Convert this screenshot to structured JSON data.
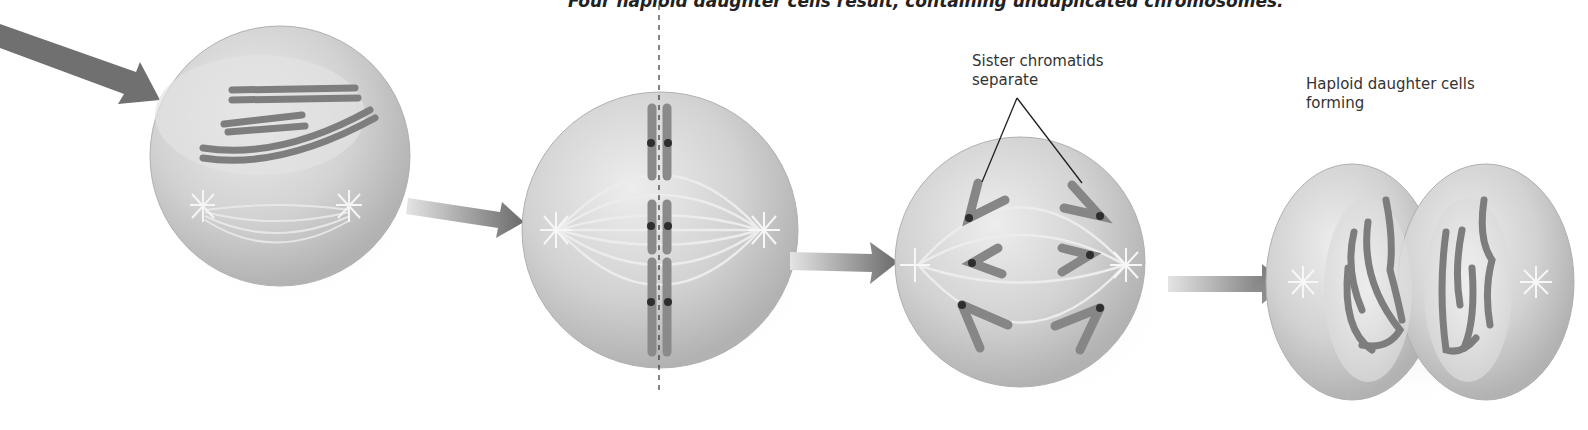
{
  "caption": "Four haploid daughter cells result, containing unduplicated chromosomes.",
  "labels": {
    "sister_chromatids_line1": "Sister chromatids",
    "sister_chromatids_line2": "separate",
    "haploid_line1": "Haploid daughter cells",
    "haploid_line2": "forming"
  },
  "stages": [
    {
      "name": "prophase-ii"
    },
    {
      "name": "metaphase-ii"
    },
    {
      "name": "anaphase-ii"
    },
    {
      "name": "telophase-ii-cytokinesis"
    }
  ],
  "colors": {
    "cell_fill": "#cfcfcf",
    "cell_edge": "#a8a8a8",
    "chromosome": "#8a8a8a",
    "arrow": "#6e6e6e",
    "centromere": "#2a2a2a"
  }
}
